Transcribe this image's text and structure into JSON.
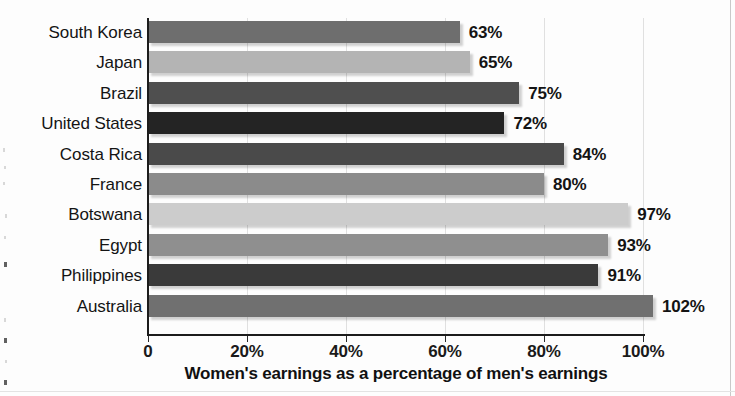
{
  "chart_data": {
    "type": "bar",
    "orientation": "horizontal",
    "title": "",
    "xlabel": "Women's earnings as a percentage of men's earnings",
    "ylabel": "",
    "xlim": [
      0,
      110
    ],
    "grid": true,
    "legend": "none",
    "xticks": [
      "0",
      "20%",
      "40%",
      "60%",
      "80%",
      "100%"
    ],
    "xtick_values": [
      0,
      20,
      40,
      60,
      80,
      100
    ],
    "categories": [
      "South Korea",
      "Japan",
      "Brazil",
      "United States",
      "Costa Rica",
      "France",
      "Botswana",
      "Egypt",
      "Philippines",
      "Australia"
    ],
    "values": [
      63,
      65,
      75,
      72,
      84,
      80,
      97,
      93,
      91,
      102
    ],
    "value_labels": [
      "63%",
      "65%",
      "75%",
      "72%",
      "84%",
      "80%",
      "97%",
      "93%",
      "91%",
      "102%"
    ],
    "bar_colors": [
      "#6e6e6e",
      "#b4b4b4",
      "#4f4f4f",
      "#242424",
      "#4a4a4a",
      "#8b8b8b",
      "#cccccc",
      "#8f8f8f",
      "#3a3a3a",
      "#707070"
    ],
    "axis_color": "#1c1c1c",
    "grid_color": "#d5d5d5",
    "text_color": "#141414",
    "background": "#fdfdfd"
  }
}
